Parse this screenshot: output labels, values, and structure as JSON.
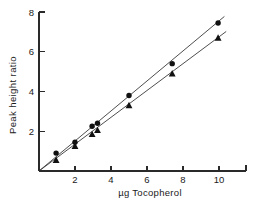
{
  "chart_data": {
    "type": "scatter",
    "title": "",
    "subtitle": "",
    "xlabel": "µg  Tocopherol",
    "ylabel": "Peak  height  ratio",
    "xlim": [
      0,
      11.5
    ],
    "ylim": [
      0,
      8
    ],
    "xticks": [
      2,
      4,
      6,
      8,
      10
    ],
    "xtick_labels": [
      "2",
      "4",
      "6",
      "8",
      "10"
    ],
    "yticks": [
      2,
      4,
      6,
      8
    ],
    "ytick_labels": [
      "2",
      "4",
      "6",
      "8"
    ],
    "grid": false,
    "legend": "none",
    "annotations": [],
    "series": [
      {
        "name": "circles",
        "marker": "circle",
        "color": "#111111",
        "fit_line": {
          "slope": 0.755,
          "intercept": 0.0,
          "x_start": 0.0,
          "x_end": 10.3
        },
        "points": [
          {
            "x": 0.95,
            "y": 0.9
          },
          {
            "x": 2.0,
            "y": 1.45
          },
          {
            "x": 2.95,
            "y": 2.25
          },
          {
            "x": 3.25,
            "y": 2.4
          },
          {
            "x": 5.0,
            "y": 3.8
          },
          {
            "x": 7.4,
            "y": 5.4
          },
          {
            "x": 9.95,
            "y": 7.45
          }
        ]
      },
      {
        "name": "triangles",
        "marker": "triangle",
        "color": "#111111",
        "fit_line": {
          "slope": 0.675,
          "intercept": 0.0,
          "x_start": 0.0,
          "x_end": 10.4
        },
        "points": [
          {
            "x": 0.95,
            "y": 0.55
          },
          {
            "x": 2.0,
            "y": 1.25
          },
          {
            "x": 2.95,
            "y": 1.85
          },
          {
            "x": 3.25,
            "y": 2.05
          },
          {
            "x": 5.0,
            "y": 3.3
          },
          {
            "x": 7.4,
            "y": 4.9
          },
          {
            "x": 9.95,
            "y": 6.7
          }
        ]
      }
    ]
  }
}
